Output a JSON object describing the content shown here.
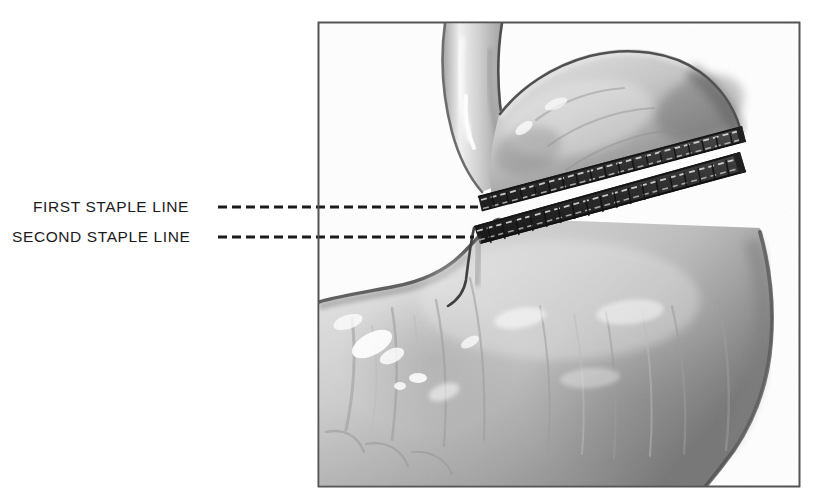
{
  "figure": {
    "kind": "medical-illustration",
    "background_color": "#ffffff",
    "frame": {
      "name": "illustration-frame",
      "x": 318,
      "y": 22,
      "width": 482,
      "height": 465,
      "border_color": "#555555",
      "border_width": 1.5,
      "fill_color": "#ffffff"
    },
    "labels": [
      {
        "id": "first-staple-line",
        "text": "FIRST STAPLE LINE",
        "x": 33,
        "y": 199,
        "color": "#1b1b1b",
        "leader": {
          "name": "leader-line-first",
          "x1": 218,
          "x2": 478,
          "y": 207,
          "style": "dashed",
          "dash": "9 5",
          "width": 3,
          "color": "#1b1b1b"
        }
      },
      {
        "id": "second-staple-line",
        "text": "SECOND STAPLE LINE",
        "x": 12,
        "y": 229,
        "color": "#1b1b1b",
        "leader": {
          "name": "leader-line-second",
          "x1": 218,
          "x2": 474,
          "y": 237,
          "style": "dashed",
          "dash": "9 5",
          "width": 3,
          "color": "#1b1b1b"
        }
      }
    ],
    "anatomy": {
      "esophagus": {
        "name": "esophagus",
        "description": "tubular structure entering from top of frame, curving down-left"
      },
      "fundus": {
        "name": "gastric-fundus",
        "description": "upper pouch bulging to the upper right, transected above first staple line"
      },
      "body": {
        "name": "gastric-body",
        "description": "large lower stomach body filling lower two thirds of frame"
      },
      "antrum": {
        "name": "gastric-antrum",
        "description": "lower-left rounded portion of the stomach"
      },
      "staple_lines": [
        {
          "name": "first-staple-line-band",
          "order": 1,
          "description": "upper transection staple row with dashed staple marks"
        },
        {
          "name": "second-staple-line-band",
          "order": 2,
          "description": "lower transection staple row with dashed staple marks"
        }
      ]
    },
    "colors": {
      "tissue_light": "#dcdcdc",
      "tissue_mid": "#b9b9b9",
      "tissue_dark": "#8a8a8a",
      "tissue_shadow": "#5d5d5d",
      "staple_band": "#3a3a3a",
      "staple_band_dark": "#1e1e1e",
      "highlight": "#ffffff",
      "outline": "#2a2a2a",
      "ink": "#1b1b1b",
      "frame_border": "#555555"
    }
  }
}
